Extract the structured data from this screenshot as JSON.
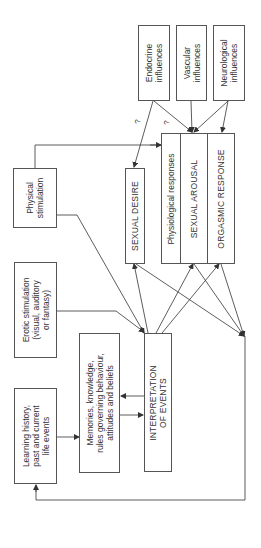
{
  "diagram": {
    "boxes": {
      "endocrine": "Endocrine\ninfluences",
      "vascular": "Vascular\ninfluences",
      "neurological": "Neurological\ninfluences",
      "physical_stimulation": "Physical\nstimulation",
      "erotic_stimulation": "Erotic stimulation\n(visual, auditory\nor fantasy)",
      "learning_history": "Learning history,\npast and current\nlife events",
      "memories": "Memories, knowledge,\nrules governing behaviour,\nattitudes and beliefs",
      "interpretation": "INTERPRETATION\nOF EVENTS",
      "sexual_desire": "SEXUAL DESIRE",
      "physiological_responses": "Physiological responses",
      "sexual_arousal": "SEXUAL AROUSAL",
      "orgasmic_response": "ORGASMIC RESPONSE"
    },
    "uncertain_markers": [
      "?",
      "?"
    ],
    "line_color": "#333333"
  }
}
